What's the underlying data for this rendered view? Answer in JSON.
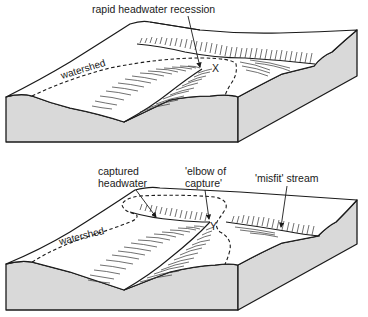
{
  "figure": {
    "top_block": {
      "labels": {
        "recession": "rapid headwater recession",
        "watershed": "watershed",
        "point": "X"
      }
    },
    "bottom_block": {
      "labels": {
        "captured": "captured",
        "headwater": "headwater",
        "elbow_line1": "'elbow of",
        "elbow_line2": "capture'",
        "misfit": "'misfit' stream",
        "watershed": "watershed",
        "point": "Y"
      }
    },
    "colors": {
      "block_face": "#d9d9d9",
      "surface": "#ffffff",
      "ink": "#1a1a1a"
    }
  }
}
